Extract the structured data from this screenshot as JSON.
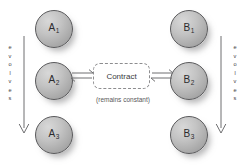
{
  "diagram": {
    "colors": {
      "sphere_light": "#d8d8d8",
      "sphere_dark": "#949496",
      "sphere_border": "#59595b",
      "dashed_border": "#8d8d8f",
      "arrow": "#6e6e70",
      "text": "#3a3a3c",
      "caption_text": "#58585a",
      "background": "#ffffff"
    },
    "left_column": {
      "evolves_label": "evolves",
      "evolves_letters": [
        "e",
        "v",
        "o",
        "l",
        "v",
        "e",
        "s"
      ],
      "arrow_direction": "down",
      "nodes": [
        {
          "id": "a1",
          "base": "A",
          "sub": "1",
          "full": "A1"
        },
        {
          "id": "a2",
          "base": "A",
          "sub": "2",
          "full": "A2"
        },
        {
          "id": "a3",
          "base": "A",
          "sub": "3",
          "full": "A3"
        }
      ]
    },
    "right_column": {
      "evolves_label": "evolves",
      "evolves_letters": [
        "e",
        "v",
        "o",
        "l",
        "v",
        "e",
        "s"
      ],
      "arrow_direction": "down",
      "nodes": [
        {
          "id": "b1",
          "base": "B",
          "sub": "1",
          "full": "B1"
        },
        {
          "id": "b2",
          "base": "B",
          "sub": "2",
          "full": "B2"
        },
        {
          "id": "b3",
          "base": "B",
          "sub": "3",
          "full": "B3"
        }
      ]
    },
    "center": {
      "box_label": "Contract",
      "caption": "(remains constant)",
      "box_border_style": "dashed",
      "left_connector": "equilibrium-arrow",
      "right_connector": "equilibrium-arrow"
    }
  }
}
